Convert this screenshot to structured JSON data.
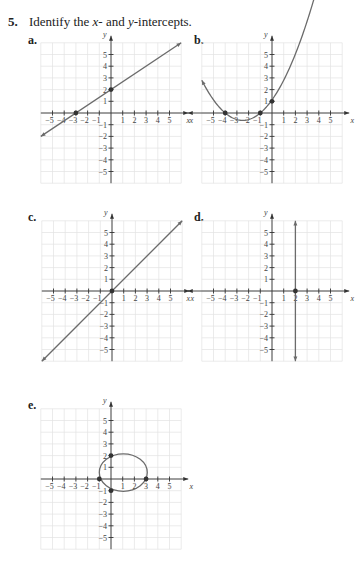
{
  "problem": {
    "number": "5.",
    "text_pre": "Identify the ",
    "text_x": "x",
    "text_mid": "- and ",
    "text_y": "y",
    "text_post": "-intercepts."
  },
  "colors": {
    "curve": "#6b6b6b",
    "grid": "#e2e2e2",
    "axis": "#333333",
    "point": "#333333"
  },
  "axis_labels": {
    "x": "x",
    "y": "y",
    "x_ticks": [
      "−5",
      "−4",
      "−3",
      "−2",
      "−1",
      "1",
      "2",
      "3",
      "4",
      "5"
    ],
    "y_ticks": [
      "5",
      "4",
      "3",
      "2",
      "1",
      "−1",
      "−2",
      "−3",
      "−4",
      "−5"
    ]
  },
  "chart_data": [
    {
      "id": "a",
      "label": "a.",
      "type": "line",
      "description": "Straight line with positive slope",
      "equation_hint": "y = (2/3)x + 2",
      "marked_points": [
        [
          -3,
          0
        ],
        [
          0,
          2
        ]
      ],
      "x_intercepts": [
        -3
      ],
      "y_intercepts": [
        2
      ],
      "xlabel": "x",
      "ylabel": "y",
      "xlim": [
        -6,
        6
      ],
      "ylim": [
        -6,
        6
      ],
      "grid": true
    },
    {
      "id": "b",
      "label": "b.",
      "type": "line",
      "description": "Upward-opening parabola",
      "equation_hint": "y = 0.25(x+4)(x+1)",
      "marked_points": [
        [
          -4,
          0
        ],
        [
          -1,
          0
        ],
        [
          0,
          1
        ]
      ],
      "x_intercepts": [
        -4,
        -1
      ],
      "y_intercepts": [
        1
      ],
      "xlabel": "x",
      "ylabel": "y",
      "xlim": [
        -6,
        6
      ],
      "ylim": [
        -6,
        6
      ],
      "grid": true
    },
    {
      "id": "c",
      "label": "c.",
      "type": "line",
      "description": "Straight line through origin",
      "equation_hint": "y = x",
      "marked_points": [
        [
          0,
          0
        ]
      ],
      "x_intercepts": [
        0
      ],
      "y_intercepts": [
        0
      ],
      "xlabel": "x",
      "ylabel": "y",
      "xlim": [
        -6,
        6
      ],
      "ylim": [
        -6,
        6
      ],
      "grid": true
    },
    {
      "id": "d",
      "label": "d.",
      "type": "line",
      "description": "Vertical line",
      "equation_hint": "x = 2",
      "marked_points": [
        [
          2,
          0
        ]
      ],
      "x_intercepts": [
        2
      ],
      "y_intercepts": [],
      "xlabel": "x",
      "ylabel": "y",
      "xlim": [
        -6,
        6
      ],
      "ylim": [
        -6,
        6
      ],
      "grid": true
    },
    {
      "id": "e",
      "label": "e.",
      "type": "line",
      "description": "Closed ellipse-like curve",
      "equation_hint": "ellipse centered near (1, 0.5)",
      "marked_points": [
        [
          -1,
          0
        ],
        [
          3,
          0
        ],
        [
          0,
          2
        ],
        [
          0,
          -1
        ]
      ],
      "x_intercepts": [
        -1,
        3
      ],
      "y_intercepts": [
        2,
        -1
      ],
      "xlabel": "x",
      "ylabel": "y",
      "xlim": [
        -6,
        6
      ],
      "ylim": [
        -6,
        6
      ],
      "grid": true
    }
  ]
}
